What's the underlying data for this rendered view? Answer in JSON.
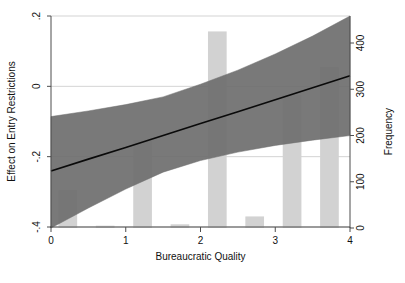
{
  "chart_data": {
    "type": "line",
    "title": "",
    "xlabel": "Bureaucratic Quality",
    "ylabel": "Effect on Entry Restrictions",
    "y2label": "Frequency",
    "xlim": [
      0,
      4
    ],
    "ylim": [
      -0.4,
      0.2
    ],
    "y2lim": [
      0,
      450
    ],
    "grid": true,
    "legend": "none",
    "xticks": [
      "0",
      "1",
      "2",
      "3",
      "4"
    ],
    "xtick_values": [
      0,
      1,
      2,
      3,
      4
    ],
    "yticks": [
      ".2",
      "0",
      "-.2",
      "-.4"
    ],
    "ytick_values": [
      0.2,
      0,
      -0.2,
      -0.4
    ],
    "y2ticks": [
      "400",
      "300",
      "200",
      "100",
      "0"
    ],
    "y2tick_values": [
      400,
      300,
      200,
      100,
      0
    ],
    "series": [
      {
        "name": "Marginal effect",
        "type": "line",
        "x": [
          0,
          0.5,
          1,
          1.5,
          2,
          2.5,
          3,
          3.5,
          4
        ],
        "values": [
          -0.241,
          -0.207,
          -0.174,
          -0.14,
          -0.106,
          -0.072,
          -0.038,
          -0.004,
          0.03
        ]
      },
      {
        "name": "95% confidence interval upper",
        "type": "band-upper",
        "x": [
          0,
          0.5,
          1,
          1.5,
          2,
          2.5,
          3,
          3.5,
          4
        ],
        "values": [
          -0.086,
          -0.07,
          -0.052,
          -0.03,
          0.006,
          0.046,
          0.092,
          0.143,
          0.2
        ]
      },
      {
        "name": "95% confidence interval lower",
        "type": "band-lower",
        "x": [
          0,
          0.5,
          1,
          1.5,
          2,
          2.5,
          3,
          3.5,
          4
        ],
        "values": [
          -0.403,
          -0.346,
          -0.292,
          -0.244,
          -0.211,
          -0.187,
          -0.168,
          -0.153,
          -0.14
        ]
      },
      {
        "name": "Frequency histogram",
        "type": "bar",
        "axis": "right",
        "bar_centers": [
          0.225,
          0.725,
          1.225,
          1.725,
          2.225,
          2.725,
          3.225,
          3.725
        ],
        "bar_width": 0.25,
        "values": [
          82,
          5,
          190,
          8,
          425,
          25,
          288,
          348
        ]
      }
    ],
    "colors": {
      "band": "#6e6e6e",
      "line": "#0a0a0a",
      "bars": "#d2d2d2",
      "grid": "#c8c8c8",
      "axis": "#4d4d4d",
      "background": "#ffffff"
    }
  }
}
